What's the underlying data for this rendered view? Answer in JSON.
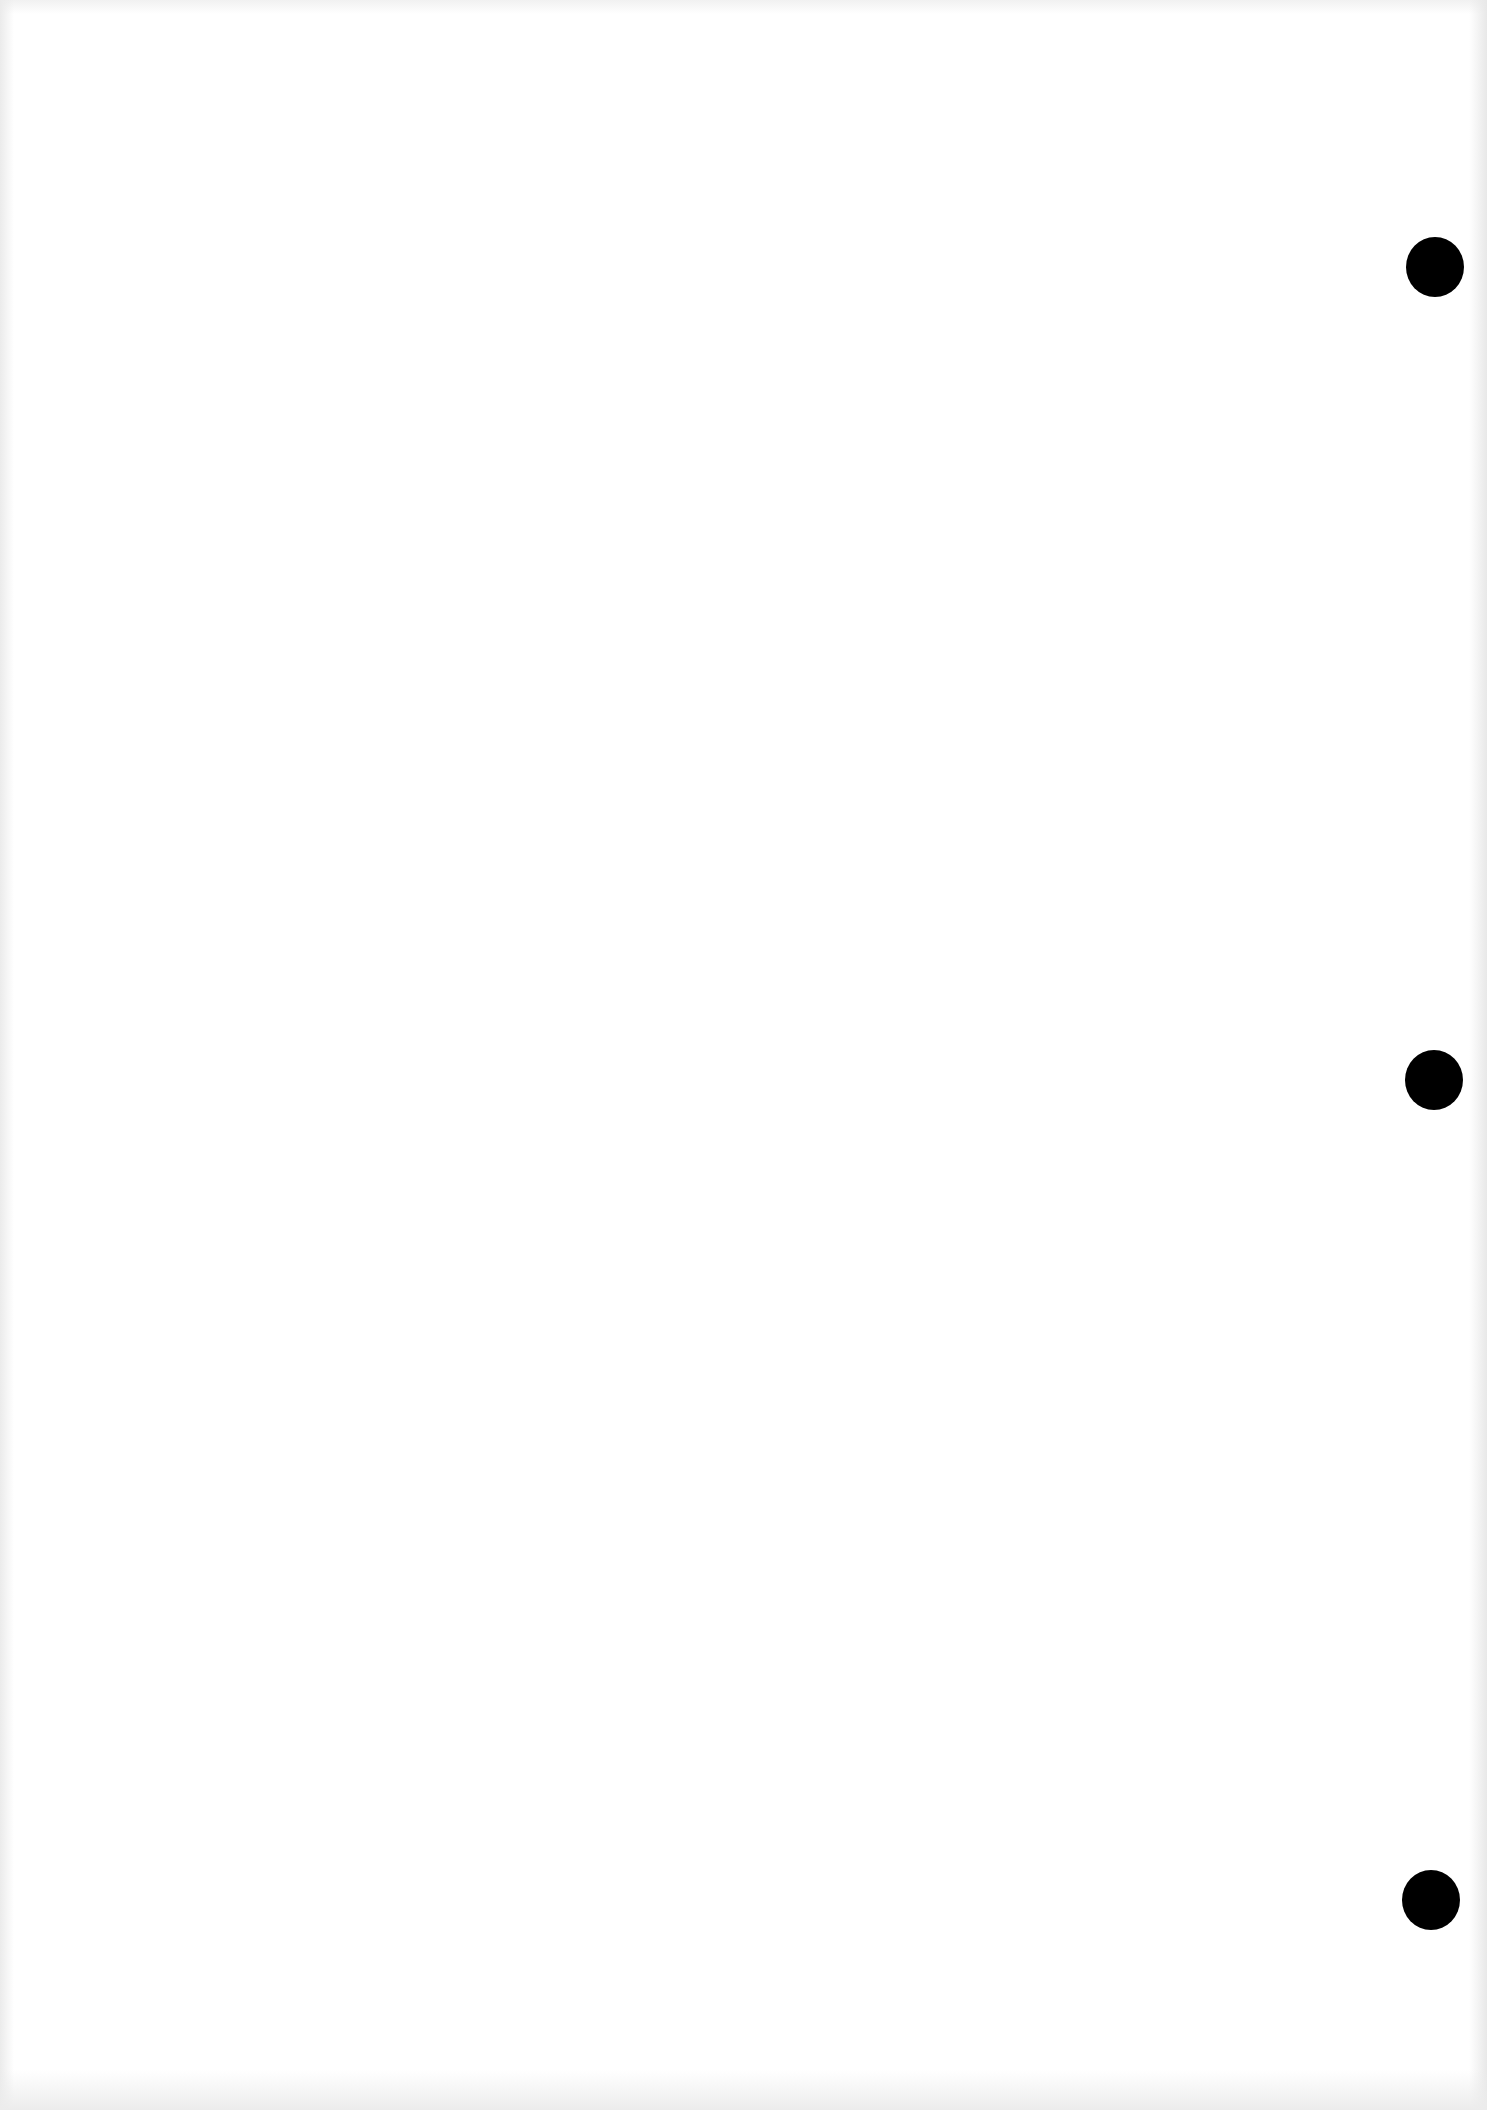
{
  "document": {
    "type": "blank scanned page",
    "text": "",
    "background_color": "#ffffff",
    "punch_holes": [
      {
        "cx": 1435,
        "cy": 267,
        "color": "#000000"
      },
      {
        "cx": 1434,
        "cy": 1080,
        "color": "#000000"
      },
      {
        "cx": 1431,
        "cy": 1900,
        "color": "#000000"
      }
    ]
  }
}
